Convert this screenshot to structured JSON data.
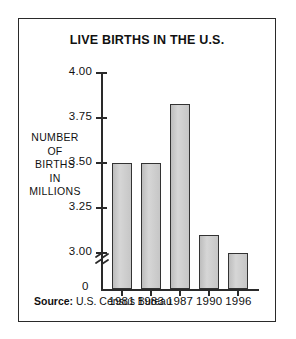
{
  "chart_data": {
    "type": "bar",
    "title": "LIVE BIRTHS IN THE U.S.",
    "xlabel": "",
    "ylabel": "NUMBER OF BIRTHS IN MILLIONS",
    "ylabel_lines": [
      "NUMBER",
      "OF",
      "BIRTHS",
      "IN",
      "MILLIONS"
    ],
    "categories": [
      "1981",
      "1983",
      "1987",
      "1990",
      "1996"
    ],
    "values": [
      3.5,
      3.5,
      3.83,
      3.1,
      3.0
    ],
    "ylim": [
      3.0,
      4.0
    ],
    "y_axis_has_break": true,
    "y_break_baseline_label": "0",
    "y_ticks": [
      {
        "label": "4.00",
        "value": 4.0
      },
      {
        "label": "3.75",
        "value": 3.75
      },
      {
        "label": "3.50",
        "value": 3.5
      },
      {
        "label": "3.25",
        "value": 3.25
      },
      {
        "label": "3.00",
        "value": 3.0
      }
    ],
    "grid": false,
    "legend": null,
    "bar_fill_color": "#c9c9c9",
    "bar_edge_color": "#333333",
    "axis_color": "#2a2a2a"
  },
  "source": {
    "label": "Source:",
    "value": "U.S. Census Bureau"
  }
}
